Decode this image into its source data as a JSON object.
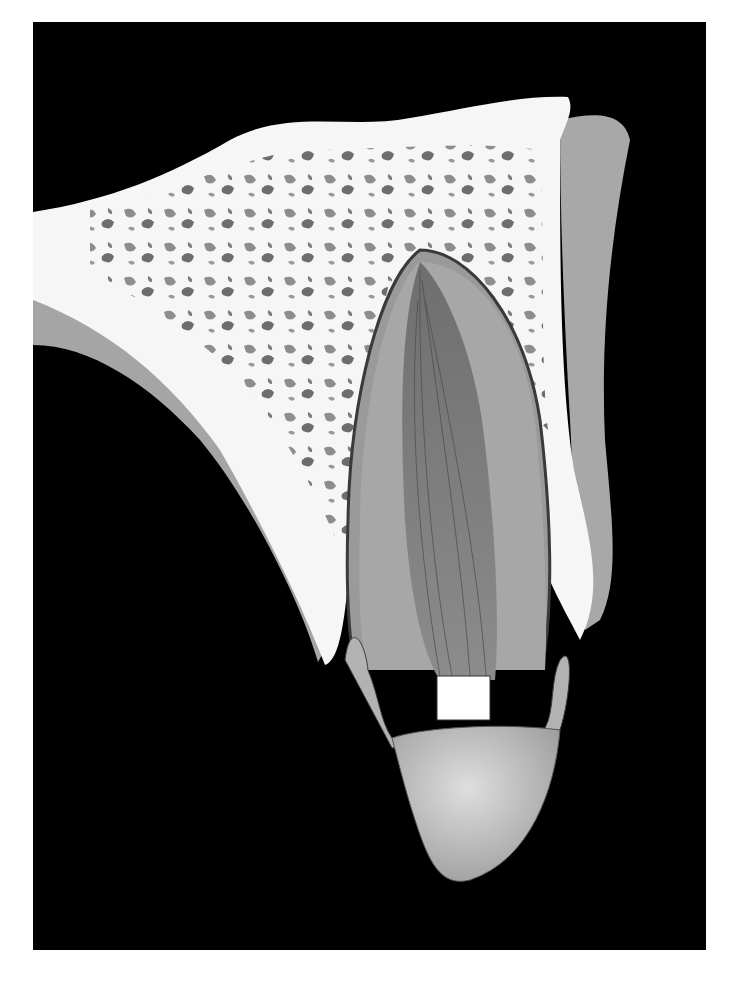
{
  "figure": {
    "colors": {
      "page": "#ffffff",
      "background": "#000000",
      "bone": "#f7f7f7",
      "bone_pore": "#6a6a6a",
      "gum": "#a9a9a9",
      "pulp_canal": "#8a8a8a",
      "dentin": "#a6a6a6",
      "enamel_crown": "#c4c4c4",
      "ligament_line": "#3a3a3a",
      "label_box": "#ffffff"
    },
    "label_box": {
      "text": ""
    }
  }
}
